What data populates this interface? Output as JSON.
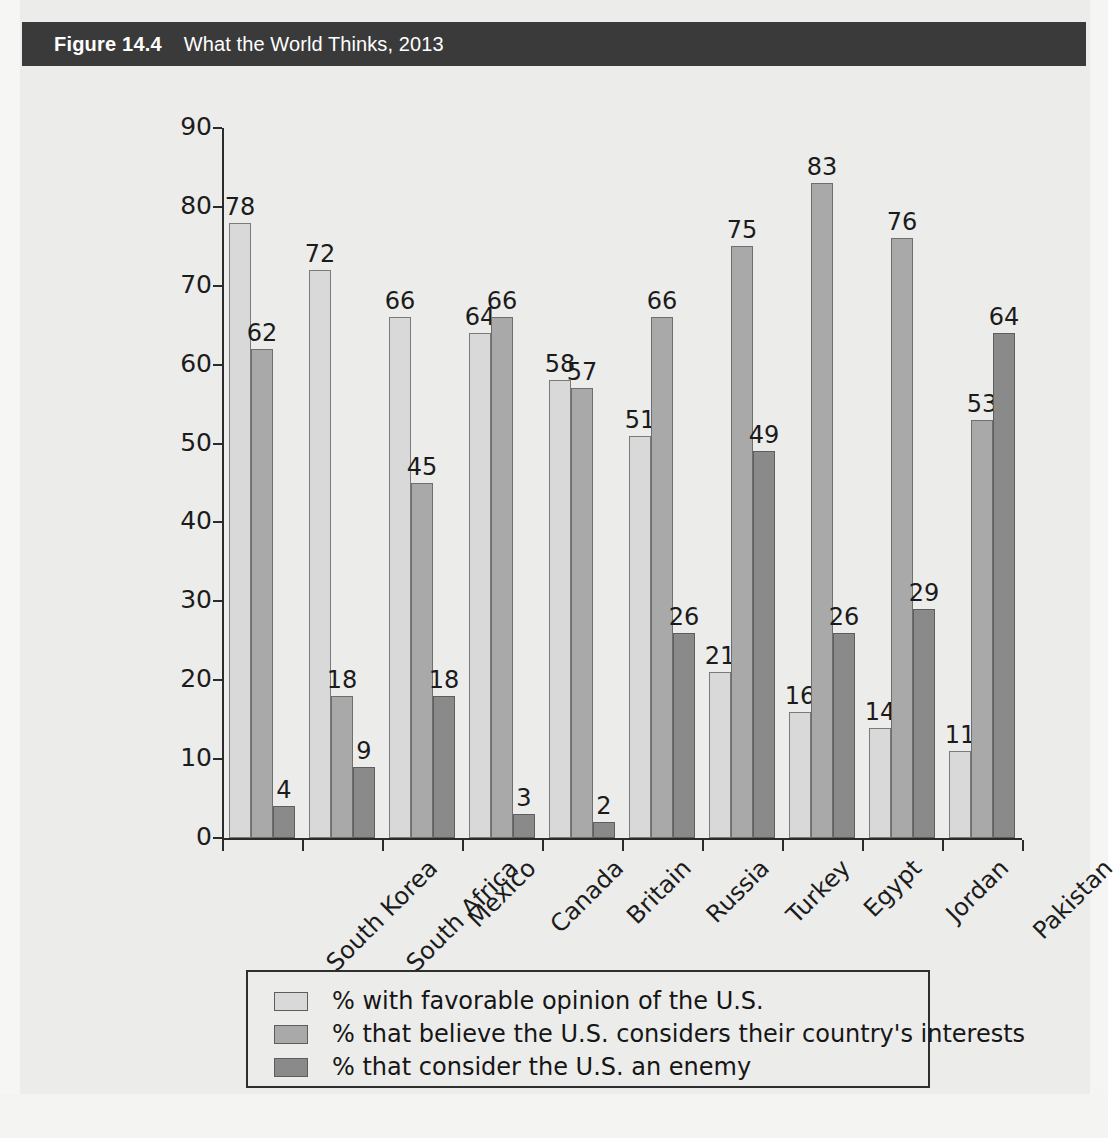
{
  "header": {
    "figure_number": "Figure 14.4",
    "title": "What the World Thinks, 2013"
  },
  "colors": {
    "header_bg": "#3a3a3a",
    "page_bg": "#ececeb",
    "series_favorable": "#d9d9d9",
    "series_considers_interests": "#a9a9a9",
    "series_enemy": "#8a8a8a",
    "axis": "#2b2b2b",
    "text": "#1b1b1b"
  },
  "chart_data": {
    "type": "bar",
    "title": "What the World Thinks, 2013",
    "xlabel": "",
    "ylabel": "",
    "ylim": [
      0,
      90
    ],
    "yticks": [
      0,
      10,
      20,
      30,
      40,
      50,
      60,
      70,
      80,
      90
    ],
    "grid": false,
    "legend_position": "bottom",
    "categories": [
      "South Korea",
      "South Africa",
      "Mexico",
      "Canada",
      "Britain",
      "Russia",
      "Turkey",
      "Egypt",
      "Jordan",
      "Pakistan"
    ],
    "series": [
      {
        "name": "% with favorable opinion of the U.S.",
        "values": [
          78,
          72,
          66,
          64,
          58,
          51,
          21,
          16,
          14,
          11
        ]
      },
      {
        "name": "% that believe the U.S. considers their country's interests",
        "values": [
          62,
          18,
          45,
          66,
          57,
          66,
          75,
          83,
          76,
          53
        ]
      },
      {
        "name": "% that consider the U.S. an enemy",
        "values": [
          4,
          9,
          18,
          3,
          2,
          26,
          49,
          26,
          29,
          64
        ]
      }
    ]
  },
  "legend": {
    "items": [
      "% with favorable opinion of the U.S.",
      "% that believe the U.S. considers their country's interests",
      "% that consider the U.S. an enemy"
    ]
  }
}
